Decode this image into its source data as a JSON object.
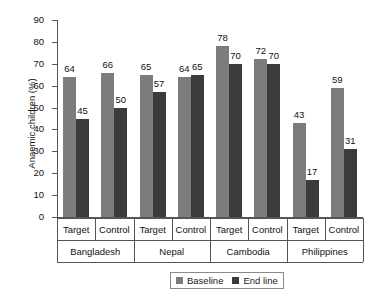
{
  "chart_data": {
    "type": "bar",
    "title": "",
    "xlabel": "",
    "ylabel": "Anaemic children (%)",
    "ylim": [
      0,
      90
    ],
    "ytick_step": 10,
    "yticks": [
      0,
      10,
      20,
      30,
      40,
      50,
      60,
      70,
      80,
      90
    ],
    "grid": false,
    "legend_position": "bottom-center",
    "groups": [
      "Bangladesh",
      "Nepal",
      "Cambodia",
      "Philippines"
    ],
    "subgroups": [
      "Target",
      "Control"
    ],
    "categories": [
      "Bangladesh Target",
      "Bangladesh Control",
      "Nepal Target",
      "Nepal Control",
      "Cambodia Target",
      "Cambodia Control",
      "Philippines Target",
      "Philippines Control"
    ],
    "series": [
      {
        "name": "Baseline",
        "color": "#7c7c7c",
        "values": [
          64,
          66,
          65,
          64,
          78,
          72,
          43,
          59
        ]
      },
      {
        "name": "End line",
        "color": "#3b3b3b",
        "values": [
          45,
          50,
          57,
          65,
          70,
          70,
          17,
          31
        ]
      }
    ]
  },
  "axis": {
    "y_title": "Anaemic children (%)",
    "y_tick_labels": [
      "90",
      "80",
      "70",
      "60",
      "50",
      "40",
      "30",
      "20",
      "10",
      "0"
    ],
    "tier1_labels": [
      "Target",
      "Control",
      "Target",
      "Control",
      "Target",
      "Control",
      "Target",
      "Control"
    ],
    "tier2_labels": [
      "Bangladesh",
      "Nepal",
      "Cambodia",
      "Philippines"
    ]
  },
  "legend": {
    "items": [
      {
        "label": "Baseline",
        "color": "#7c7c7c"
      },
      {
        "label": "End line",
        "color": "#3b3b3b"
      }
    ]
  }
}
